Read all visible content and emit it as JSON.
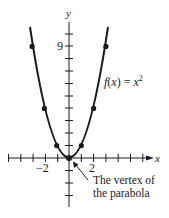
{
  "diagram": {
    "function_label": "f(x) = x²",
    "function_label_parts": {
      "f": "f",
      "open": "(",
      "x": "x",
      "close": ")",
      "eq": " = ",
      "base": "x",
      "exp": "2"
    },
    "axis_x_label": "x",
    "axis_y_label": "y",
    "tick_labels": {
      "x_neg2": "−2",
      "x_pos2": "2",
      "y_9": "9"
    },
    "annotation": {
      "line1": "The vertex of",
      "line2": "the parabola"
    },
    "points": [
      {
        "x": -3,
        "y": 9
      },
      {
        "x": -2,
        "y": 4
      },
      {
        "x": -1,
        "y": 1
      },
      {
        "x": 0,
        "y": 0
      },
      {
        "x": 1,
        "y": 1
      },
      {
        "x": 2,
        "y": 4
      },
      {
        "x": 3,
        "y": 9
      }
    ],
    "colors": {
      "ink": "#1a1a1a",
      "background": "#ffffff"
    }
  }
}
